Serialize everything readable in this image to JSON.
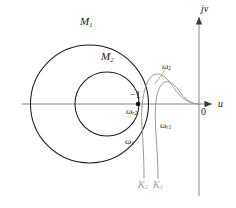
{
  "figure": {
    "axes": {
      "imaginary_label": "jv",
      "real_label": "u",
      "origin_label": "0",
      "origin_px": {
        "x": 199,
        "y": 104
      },
      "real_axis_y": 104,
      "imag_axis_x": 199
    },
    "critical_point": {
      "label": "−1",
      "x_px": 138,
      "y_px": 104
    },
    "m_circles": [
      {
        "name": "M1",
        "label": "M",
        "sub": "1",
        "cx": 89.5,
        "cy": 104,
        "r": 59,
        "color": "#1a1a1a",
        "label_x": 86,
        "label_y": 22
      },
      {
        "name": "M2",
        "label": "M",
        "sub": "2",
        "cx": 107,
        "cy": 104,
        "r": 32,
        "color": "#1a1a1a",
        "label_x": 107,
        "label_y": 57
      }
    ],
    "nyquist_curves": [
      {
        "name": "K1",
        "gain_label": "K",
        "gain_sub": "1",
        "color": "#9a9a9a",
        "resonance_label": "ω",
        "resonance_sub": "r1",
        "start_freq_label": "ω",
        "start_freq_sub": "1"
      },
      {
        "name": "K2",
        "gain_label": "K",
        "gain_sub": "2",
        "color": "#9a9a9a",
        "resonance_label": "ω",
        "resonance_sub": "r2",
        "peak_freq_label": "ω",
        "peak_freq_sub": "2"
      }
    ],
    "labels": {
      "m1": {
        "text": "M",
        "sub": "1"
      },
      "m2": {
        "text": "M",
        "sub": "2"
      },
      "omega_2": {
        "text": "ω",
        "sub": "2"
      },
      "omega_1": {
        "text": "ω",
        "sub": "1"
      },
      "omega_r1": {
        "text": "ω",
        "sub": "r1"
      },
      "omega_r2": {
        "text": "ω",
        "sub": "r2"
      },
      "k1": {
        "text": "K",
        "sub": "1"
      },
      "k2": {
        "text": "K",
        "sub": "2"
      },
      "jv": {
        "text": "jv"
      },
      "u": {
        "text": "u"
      },
      "zero": {
        "text": "0"
      },
      "minus_one": {
        "text": "−1"
      }
    },
    "colors": {
      "curve_primary": "#1a1a1a",
      "curve_secondary": "#9a9a9a",
      "axis": "#6e6e6e",
      "background": "#ffffff"
    }
  }
}
